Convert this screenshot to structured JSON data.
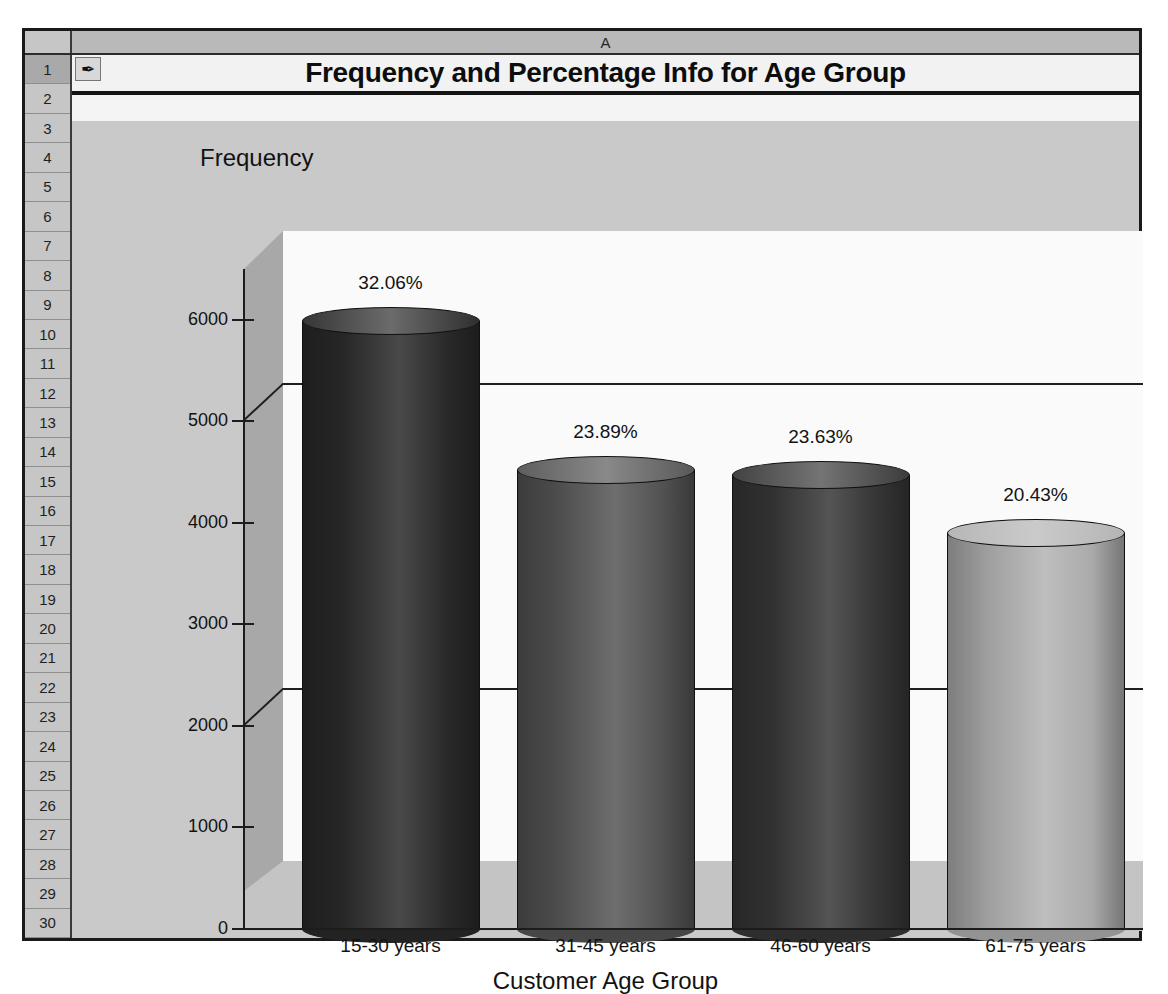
{
  "spreadsheet": {
    "column_header": "A",
    "row_numbers": [
      1,
      2,
      3,
      4,
      5,
      6,
      7,
      8,
      9,
      10,
      11,
      12,
      13,
      14,
      15,
      16,
      17,
      18,
      19,
      20,
      21,
      22,
      23,
      24,
      25,
      26,
      27,
      28,
      29,
      30
    ],
    "selected_row": 1,
    "note_icon": "pen-note-icon",
    "note_icon_glyph": "✒"
  },
  "title": "Frequency and Percentage Info for Age Group",
  "chart_data": {
    "type": "bar",
    "title": "Frequency and Percentage Info for Age Group",
    "xlabel": "Customer Age Group",
    "ylabel": "Frequency",
    "categories": [
      "15-30 years",
      "31-45 years",
      "46-60 years",
      "61-75 years"
    ],
    "values": [
      5750,
      4285,
      4238,
      3665
    ],
    "data_labels": [
      "32.06%",
      "23.89%",
      "23.63%",
      "20.43%"
    ],
    "percentages": [
      32.06,
      23.89,
      23.63,
      20.43
    ],
    "ylim": [
      0,
      6500
    ],
    "yticks": [
      0,
      1000,
      2000,
      3000,
      4000,
      5000,
      6000
    ],
    "ytick_labels": [
      "0",
      "1000",
      "2000",
      "3000",
      "4000",
      "5000",
      "6000"
    ],
    "gridlines": [
      2000,
      5000
    ],
    "grid": true,
    "legend": false,
    "style": "3d-cylinder",
    "bar_colors": [
      "#2b2b2b",
      "#565656",
      "#383838",
      "#b3b3b3"
    ]
  },
  "colors": {
    "sheet_background": "#c9c9c9",
    "header_gray": "#c6c6c6",
    "plot_back_wall": "#fafafa",
    "plot_left_wall": "#a8a8a8",
    "plot_floor": "#c4c4c4",
    "axis_black": "#1c1c1c"
  }
}
